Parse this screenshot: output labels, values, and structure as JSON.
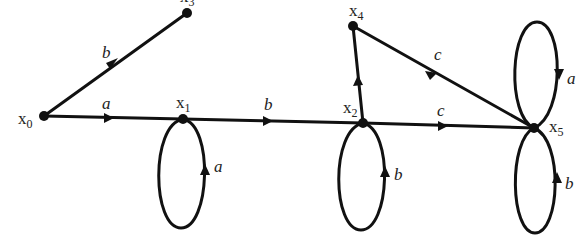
{
  "diagram": {
    "type": "state-transition-graph",
    "nodes": [
      {
        "id": "x0",
        "label": "x",
        "sub": "0",
        "x": 44,
        "y": 116
      },
      {
        "id": "x1",
        "label": "x",
        "sub": "1",
        "x": 183,
        "y": 119
      },
      {
        "id": "x2",
        "label": "x",
        "sub": "2",
        "x": 363,
        "y": 123
      },
      {
        "id": "x3",
        "label": "x",
        "sub": "3",
        "x": 187,
        "y": 13
      },
      {
        "id": "x4",
        "label": "x",
        "sub": "4",
        "x": 353,
        "y": 26
      },
      {
        "id": "x5",
        "label": "x",
        "sub": "5",
        "x": 534,
        "y": 128
      }
    ],
    "edges": [
      {
        "from": "x0",
        "to": "x3",
        "label": "b"
      },
      {
        "from": "x0",
        "to": "x1",
        "label": "a"
      },
      {
        "from": "x1",
        "to": "x1",
        "label": "a",
        "loop": "down"
      },
      {
        "from": "x1",
        "to": "x2",
        "label": "b"
      },
      {
        "from": "x2",
        "to": "x2",
        "label": "b",
        "loop": "down"
      },
      {
        "from": "x2",
        "to": "x4",
        "label": ""
      },
      {
        "from": "x2",
        "to": "x5",
        "label": "c"
      },
      {
        "from": "x4",
        "to": "x5",
        "label": "c"
      },
      {
        "from": "x5",
        "to": "x5",
        "label": "a",
        "loop": "up"
      },
      {
        "from": "x5",
        "to": "x5",
        "label": "b",
        "loop": "down"
      }
    ]
  },
  "labels": {
    "x0": {
      "main": "x",
      "sub": "0"
    },
    "x1": {
      "main": "x",
      "sub": "1"
    },
    "x2": {
      "main": "x",
      "sub": "2"
    },
    "x3": {
      "main": "x",
      "sub": "3"
    },
    "x4": {
      "main": "x",
      "sub": "4"
    },
    "x5": {
      "main": "x",
      "sub": "5"
    },
    "e_x0_x3": "b",
    "e_x0_x1": "a",
    "e_x1_loop": "a",
    "e_x1_x2": "b",
    "e_x2_loop": "b",
    "e_x2_x5": "c",
    "e_x4_x5": "c",
    "e_x5_loop_up": "a",
    "e_x5_loop_down": "b"
  }
}
